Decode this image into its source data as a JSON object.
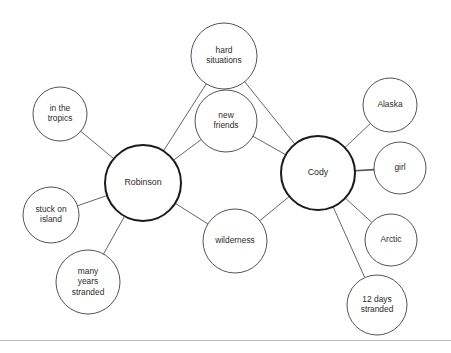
{
  "diagram": {
    "type": "bubble-map",
    "title_visible": false,
    "background_color": "#ffffff",
    "main_stroke_color": "#1a1a1a",
    "node_stroke_color": "#404040",
    "connector_color": "#555555",
    "text_color": "#2b2b2b",
    "main_nodes": [
      {
        "id": "robinson",
        "label": "Robinson",
        "cx": 143,
        "cy": 183,
        "r": 38
      },
      {
        "id": "cody",
        "label": "Cody",
        "cx": 318,
        "cy": 173,
        "r": 37
      }
    ],
    "attribute_nodes": [
      {
        "id": "hard-situations",
        "label": "hard situations",
        "lines": [
          "hard",
          "situations"
        ],
        "cx": 224,
        "cy": 56,
        "r": 33,
        "connects": [
          "robinson",
          "cody"
        ]
      },
      {
        "id": "new-friends",
        "label": "new friends",
        "lines": [
          "new",
          "friends"
        ],
        "cx": 226,
        "cy": 121,
        "r": 31,
        "connects": [
          "robinson",
          "cody"
        ]
      },
      {
        "id": "wilderness",
        "label": "wilderness",
        "lines": [
          "wilderness"
        ],
        "cx": 235,
        "cy": 241,
        "r": 32,
        "connects": [
          "robinson",
          "cody"
        ]
      },
      {
        "id": "in-the-tropics",
        "label": "in the tropics",
        "lines": [
          "in the",
          "tropics"
        ],
        "cx": 60,
        "cy": 114,
        "r": 27,
        "connects": [
          "robinson"
        ]
      },
      {
        "id": "stuck-on-island",
        "label": "stuck on island",
        "lines": [
          "stuck on",
          "island"
        ],
        "cx": 51,
        "cy": 215,
        "r": 28,
        "connects": [
          "robinson"
        ]
      },
      {
        "id": "many-years-stranded",
        "label": "many years stranded",
        "lines": [
          "many",
          "years",
          "stranded"
        ],
        "cx": 88,
        "cy": 282,
        "r": 32,
        "connects": [
          "robinson"
        ]
      },
      {
        "id": "alaska",
        "label": "Alaska",
        "lines": [
          "Alaska"
        ],
        "cx": 390,
        "cy": 105,
        "r": 27,
        "connects": [
          "cody"
        ]
      },
      {
        "id": "girl",
        "label": "girl",
        "lines": [
          "girl"
        ],
        "cx": 400,
        "cy": 168,
        "r": 26,
        "connects": [
          "cody"
        ]
      },
      {
        "id": "arctic",
        "label": "Arctic",
        "lines": [
          "Arctic"
        ],
        "cx": 391,
        "cy": 240,
        "r": 26,
        "connects": [
          "cody"
        ]
      },
      {
        "id": "twelve-days-stranded",
        "label": "12 days stranded",
        "lines": [
          "12 days",
          "stranded"
        ],
        "cx": 377,
        "cy": 305,
        "r": 30,
        "connects": [
          "cody"
        ]
      }
    ],
    "bottom_rule": {
      "y": 340,
      "color": "#b8b8b8"
    }
  }
}
